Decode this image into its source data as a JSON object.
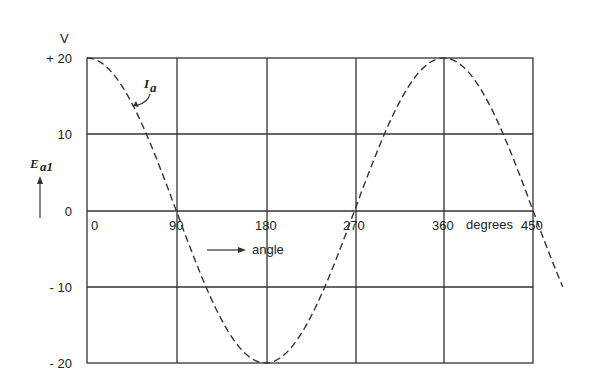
{
  "chart_data": {
    "type": "line",
    "title": "",
    "xlabel": "angle",
    "x_unit": "degrees",
    "ylabel": "E_a1",
    "y_unit": "V",
    "xlim": [
      0,
      450
    ],
    "ylim": [
      -20,
      20
    ],
    "x_ticks": [
      "0",
      "90",
      "180",
      "270",
      "360",
      "450"
    ],
    "y_ticks": [
      "+ 20",
      "10",
      "0",
      "- 10",
      "- 20"
    ],
    "grid": true,
    "series": [
      {
        "name": "I_a",
        "style": "dashed",
        "x": [
          0,
          45,
          90,
          135,
          180,
          225,
          270,
          315,
          360,
          405,
          450,
          480
        ],
        "values": [
          20,
          14.1,
          0,
          -14.1,
          -20,
          -14.1,
          0,
          14.1,
          20,
          14.1,
          0,
          -10
        ]
      }
    ],
    "annotations": [
      "I_a",
      "→ angle",
      "E_a1 ↑"
    ]
  },
  "labels": {
    "y_unit": "V",
    "y_axis_name": "E",
    "y_axis_sub": "a1",
    "curve_name": "I",
    "curve_sub": "a",
    "x_arrow_label": "angle",
    "degrees": "degrees",
    "y_ticks": [
      "+ 20",
      "10",
      "0",
      "- 10",
      "- 20"
    ],
    "x_ticks": [
      "0",
      "90",
      "180",
      "270",
      "360",
      "450"
    ]
  }
}
